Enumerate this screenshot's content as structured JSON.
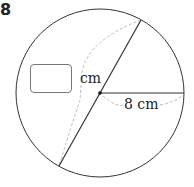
{
  "question": {
    "number": "8"
  },
  "diagram": {
    "circle": {
      "cx": 100,
      "cy": 93,
      "r": 84,
      "stroke": "#333333"
    },
    "diameter": {
      "x1": 141,
      "y1": 20,
      "x2": 59,
      "y2": 166
    },
    "radius_line": {
      "x1": 100,
      "y1": 93,
      "x2": 184,
      "y2": 93
    },
    "center_point": {
      "x": 100,
      "y": 93
    },
    "radius_label": "8 cm",
    "unknown_unit": "cm",
    "answer_box": {
      "value": ""
    },
    "dashed_color": "#aaaaaa"
  }
}
